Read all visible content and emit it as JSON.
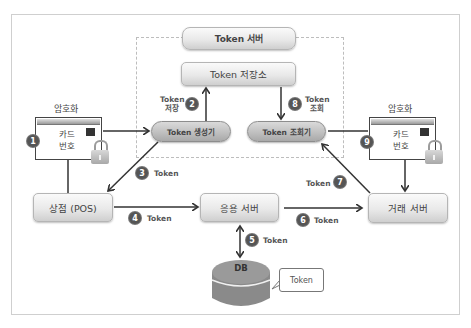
{
  "token_server": {
    "title": "Token 서버",
    "storage": "Token 저장소",
    "generator": "Token 생성기",
    "lookup": "Token 조회기"
  },
  "left_card": {
    "label": "암호화",
    "text_line1": "카드",
    "text_line2": "번호",
    "step": "1"
  },
  "right_card": {
    "label": "암호화",
    "text_line1": "카드",
    "text_line2": "번호",
    "step": "9"
  },
  "nodes": {
    "pos": "상점 (POS)",
    "app_server": "응용 서버",
    "transaction_server": "거래 서버",
    "db": "DB",
    "db_bubble": "Token"
  },
  "steps": [
    {
      "num": "1",
      "label": ""
    },
    {
      "num": "2",
      "label_line1": "Token",
      "label_line2": "저장"
    },
    {
      "num": "3",
      "label": "Token"
    },
    {
      "num": "4",
      "label": "Token"
    },
    {
      "num": "5",
      "label": "Token"
    },
    {
      "num": "6",
      "label": "Token"
    },
    {
      "num": "7",
      "label": "Token"
    },
    {
      "num": "8",
      "label_line1": "Token",
      "label_line2": "조회"
    },
    {
      "num": "9",
      "label": ""
    }
  ],
  "colors": {
    "frame": "#cfcfcf",
    "box_light": "#e9e9e9",
    "box_dark": "#bdbdbd",
    "step_circle": "#555555",
    "db": "#8a8a8a",
    "arrow": "#333333"
  }
}
